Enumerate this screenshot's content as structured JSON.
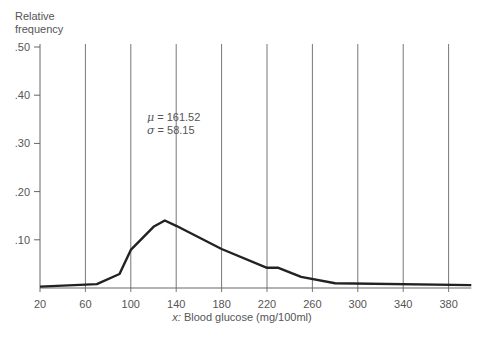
{
  "chart_data": {
    "type": "line",
    "title": "",
    "xlabel_var": "x:",
    "xlabel": "Blood glucose (mg/100ml)",
    "ylabel": "Relative\nfrequency",
    "ylabel_line1": "Relative",
    "ylabel_line2": "frequency",
    "xlim": [
      20,
      400
    ],
    "ylim": [
      0,
      0.5
    ],
    "x_ticks": [
      20,
      60,
      100,
      140,
      180,
      220,
      260,
      300,
      340,
      380
    ],
    "y_ticks": [
      ".10",
      ".20",
      ".30",
      ".40",
      ".50"
    ],
    "y_tick_values": [
      0.1,
      0.2,
      0.3,
      0.4,
      0.5
    ],
    "grid": "vertical",
    "annotations": {
      "mu_symbol": "μ",
      "mu_text": " = 161.52",
      "sigma_symbol": "σ",
      "sigma_text": " = 58.15"
    },
    "series": [
      {
        "name": "Relative frequency",
        "color": "#222222",
        "x": [
          20,
          70,
          90,
          100,
          120,
          130,
          140,
          180,
          220,
          230,
          250,
          280,
          400
        ],
        "y": [
          0.003,
          0.008,
          0.029,
          0.079,
          0.127,
          0.14,
          0.129,
          0.081,
          0.042,
          0.042,
          0.023,
          0.01,
          0.006
        ]
      }
    ]
  }
}
